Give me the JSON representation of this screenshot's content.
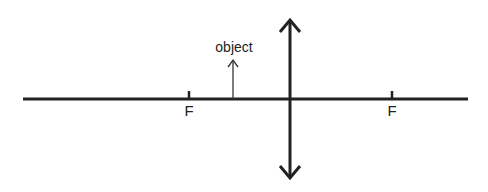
{
  "diagram": {
    "type": "converging-lens-ray-diagram",
    "colors": {
      "line": "#222222",
      "background": "#ffffff"
    },
    "principal_axis": {
      "x1": 23,
      "x2": 468,
      "y": 99
    },
    "lens": {
      "x": 290,
      "y_top": 18,
      "y_bottom": 180,
      "arrows": "both-ends"
    },
    "focal_points": [
      {
        "label": "F",
        "x": 189
      },
      {
        "label": "F",
        "x": 392
      }
    ],
    "object": {
      "label": "object",
      "x": 233,
      "y_base": 99,
      "y_tip": 60
    }
  }
}
